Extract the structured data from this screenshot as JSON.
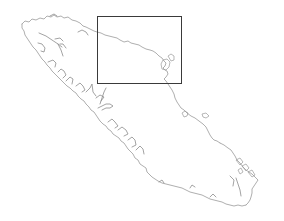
{
  "map": {
    "region": "Vancouver Island coastline outline",
    "style": {
      "background": "#ffffff",
      "coastline_color": "#9a9a9a",
      "inset_box_color": "#3a3a3a"
    },
    "inset_box": {
      "x": 97,
      "y": 16,
      "width": 84,
      "height": 67
    }
  }
}
